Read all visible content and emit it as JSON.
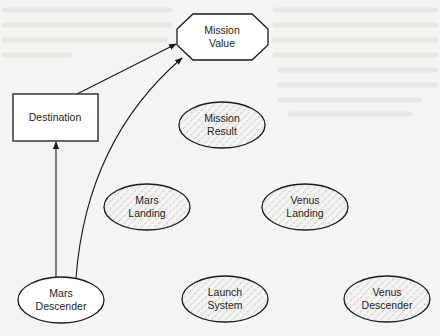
{
  "diagram": {
    "type": "influence-diagram",
    "nodes": [
      {
        "id": "mission-value",
        "label_lines": [
          "Mission",
          "Value"
        ],
        "shape": "octagon",
        "fill": "white"
      },
      {
        "id": "destination",
        "label_lines": [
          "Destination"
        ],
        "shape": "rectangle",
        "fill": "white"
      },
      {
        "id": "mission-result",
        "label_lines": [
          "Mission",
          "Result"
        ],
        "shape": "ellipse",
        "fill": "hatched"
      },
      {
        "id": "mars-landing",
        "label_lines": [
          "Mars",
          "Landing"
        ],
        "shape": "ellipse",
        "fill": "hatched"
      },
      {
        "id": "venus-landing",
        "label_lines": [
          "Venus",
          "Landing"
        ],
        "shape": "ellipse",
        "fill": "hatched"
      },
      {
        "id": "mars-descender",
        "label_lines": [
          "Mars",
          "Descender"
        ],
        "shape": "ellipse",
        "fill": "white"
      },
      {
        "id": "launch-system",
        "label_lines": [
          "Launch",
          "System"
        ],
        "shape": "ellipse",
        "fill": "hatched"
      },
      {
        "id": "venus-descender",
        "label_lines": [
          "Venus",
          "Descender"
        ],
        "shape": "ellipse",
        "fill": "hatched"
      }
    ],
    "edges": [
      {
        "from": "destination",
        "to": "mission-value",
        "style": "straight"
      },
      {
        "from": "mars-descender",
        "to": "destination",
        "style": "straight"
      },
      {
        "from": "mars-descender",
        "to": "mission-value",
        "style": "curved"
      }
    ],
    "colors": {
      "stroke": "#1a1a1a",
      "background": "#f4f4f2",
      "hatch": "#8a8a8a"
    }
  }
}
